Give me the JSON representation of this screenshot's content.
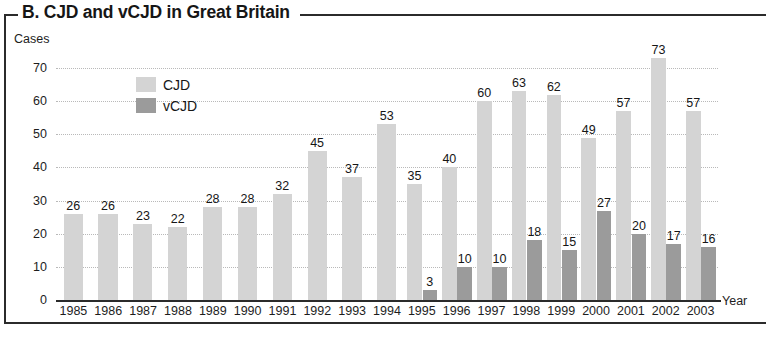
{
  "panel": {
    "title": "B. CJD and vCJD in Great Britain"
  },
  "legend": {
    "position": "inside-top-left",
    "entries": [
      {
        "label": "CJD",
        "color": "#d4d4d4"
      },
      {
        "label": "vCJD",
        "color": "#9b9b9b"
      }
    ]
  },
  "axes": {
    "y_title": "Cases",
    "x_title": "Year",
    "yticks": [
      0,
      10,
      20,
      30,
      40,
      50,
      60,
      70
    ]
  },
  "chart_data": {
    "type": "bar",
    "title": "B. CJD and vCJD in Great Britain",
    "xlabel": "Year",
    "ylabel": "Cases",
    "ylim": [
      0,
      70
    ],
    "yticks": [
      0,
      10,
      20,
      30,
      40,
      50,
      60,
      70
    ],
    "grid": true,
    "legend_position": "inside-top-left",
    "categories": [
      "1985",
      "1986",
      "1987",
      "1988",
      "1989",
      "1990",
      "1991",
      "1992",
      "1993",
      "1994",
      "1995",
      "1996",
      "1997",
      "1998",
      "1999",
      "2000",
      "2001",
      "2002",
      "2003"
    ],
    "series": [
      {
        "name": "CJD",
        "color": "#d4d4d4",
        "values": [
          26,
          26,
          23,
          22,
          28,
          28,
          32,
          45,
          37,
          53,
          35,
          40,
          60,
          63,
          62,
          49,
          57,
          73,
          57
        ],
        "labels": [
          "26",
          "26",
          "23",
          "22",
          "28",
          "28",
          "32",
          "45",
          "37",
          "53",
          "35",
          "40",
          "60",
          "63",
          "62",
          "49",
          "57",
          "73",
          "57"
        ]
      },
      {
        "name": "vCJD",
        "color": "#9b9b9b",
        "values": [
          null,
          null,
          null,
          null,
          null,
          null,
          null,
          null,
          null,
          null,
          3,
          10,
          10,
          18,
          15,
          27,
          20,
          17,
          16
        ],
        "labels": [
          "",
          "",
          "",
          "",
          "",
          "",
          "",
          "",
          "",
          "",
          "3",
          "10",
          "10",
          "18",
          "15",
          "27",
          "20",
          "17",
          "16"
        ]
      }
    ]
  }
}
